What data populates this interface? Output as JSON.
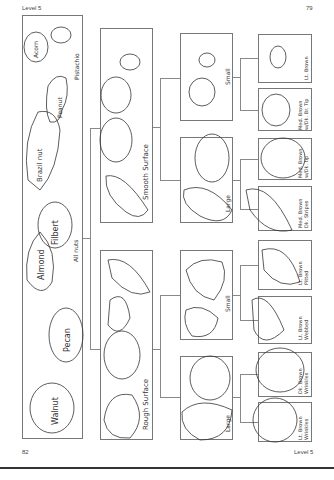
{
  "page": {
    "header_left": "Level 5",
    "header_right": "79",
    "footer_left": "82",
    "footer_right": "Level 5"
  },
  "diagram": {
    "orientation": "rotated 90° counter-clockwise",
    "root": {
      "label": "All nuts",
      "items": [
        "Walnut",
        "Pecan",
        "Almond",
        "Filbert",
        "Brazil nut",
        "Peanut",
        "Acorn",
        "Pistachio"
      ]
    },
    "level2": [
      {
        "label": "Smooth Surface"
      },
      {
        "label": "Rough Surface"
      }
    ],
    "level3": [
      {
        "label": "Small",
        "parent": "Smooth Surface"
      },
      {
        "label": "Large",
        "parent": "Smooth Surface"
      },
      {
        "label": "Small",
        "parent": "Rough Surface"
      },
      {
        "label": "Large",
        "parent": "Rough Surface"
      }
    ],
    "level4": [
      {
        "label": "Lt. Brown",
        "parent": "Smooth Small"
      },
      {
        "label": "Med. Brown w/Dk. Br. Tip",
        "parent": "Smooth Small"
      },
      {
        "label": "Med. Brown w/Dk. tip",
        "parent": "Smooth Large"
      },
      {
        "label": "Med. Brown Dk. Stripes",
        "parent": "Smooth Large"
      },
      {
        "label": "Lt. Brown Pitted",
        "parent": "Rough Small"
      },
      {
        "label": "Lt. Brown Webbed",
        "parent": "Rough Small"
      },
      {
        "label": "Dk. Brown Wrinkles",
        "parent": "Rough Large"
      },
      {
        "label": "Lt. Brown Wrinkles",
        "parent": "Rough Large"
      }
    ]
  }
}
